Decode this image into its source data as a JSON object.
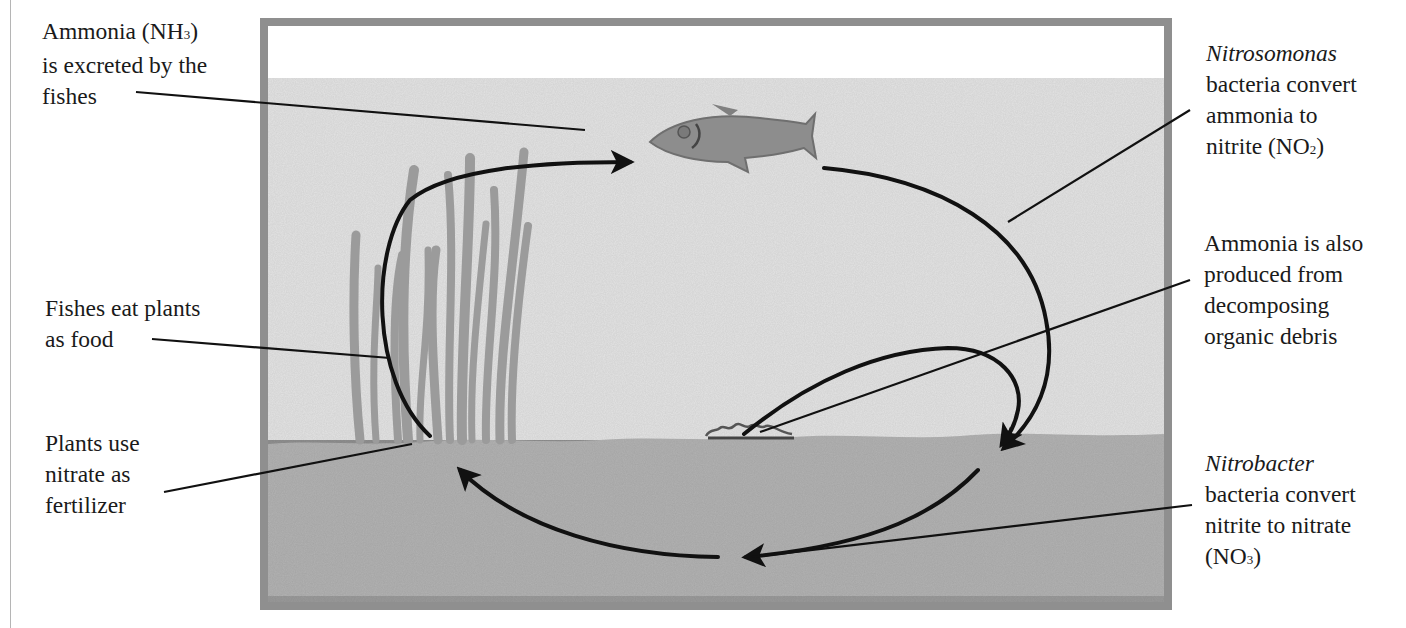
{
  "labels": {
    "ammonia_excreted": {
      "lines": [
        "Ammonia (NH",
        "3",
        ")",
        "is excreted by the",
        "fishes"
      ]
    },
    "fish_eat_plants": {
      "lines": [
        "Fishes eat plants",
        "as food"
      ]
    },
    "plants_use_nitrate": {
      "lines": [
        "Plants use",
        "nitrate as",
        "fertilizer"
      ]
    },
    "nitrosomonas": {
      "genus": "Nitrosomonas",
      "lines": [
        "bacteria convert",
        "ammonia to",
        "nitrite (NO",
        "2",
        ")"
      ]
    },
    "ammonia_debris": {
      "lines": [
        "Ammonia is also",
        "produced from",
        "decomposing",
        "organic debris"
      ]
    },
    "nitrobacter": {
      "genus": "Nitrobacter",
      "lines": [
        "bacteria convert",
        "nitrite to nitrate",
        "(NO",
        "3",
        ")"
      ]
    }
  },
  "illustration": {
    "elements": [
      "aquarium-tank",
      "water",
      "gravel-substrate",
      "fish",
      "aquatic-plants",
      "organic-debris"
    ],
    "cycle_arrows": [
      "plants-to-fish",
      "fish-to-substrate",
      "debris-to-substrate",
      "substrate-to-center",
      "center-to-plants"
    ]
  },
  "colors": {
    "tank_frame": "#8f8f8f",
    "water": "#e4e4e4",
    "air_gap": "#ffffff",
    "substrate": "#b3b3b3",
    "fish": "#8a8a8a",
    "plants": "#9a9a9a",
    "arrows": "#111111",
    "text": "#1a1a1a"
  }
}
